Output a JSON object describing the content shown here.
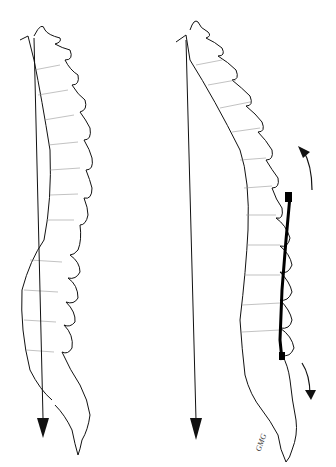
{
  "figure": {
    "panels": [
      {
        "id": "left",
        "label": "Normal spinal alignment with plumb line"
      },
      {
        "id": "right",
        "label": "Altered spinal alignment with plumb line and rotation arrows"
      }
    ],
    "signature": "GMG",
    "colors": {
      "line": "#111111",
      "background": "#ffffff"
    }
  }
}
